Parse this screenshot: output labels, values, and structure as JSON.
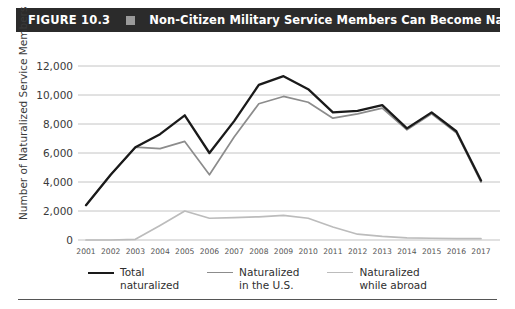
{
  "header": {
    "figure_number": "FIGURE 10.3",
    "marker_icon": "square-marker",
    "title": "Non-Citizen Military Service Members Can Become Naturalized",
    "bar_color": "#2b2b2b",
    "text_color": "#ffffff"
  },
  "legend": {
    "position": "bottom-center",
    "items": [
      {
        "label": "Total\nnaturalized",
        "color": "#1a1a1a"
      },
      {
        "label": "Naturalized\nin the U.S.",
        "color": "#8c8c8c"
      },
      {
        "label": "Naturalized\nwhile abroad",
        "color": "#bcbcbc"
      }
    ]
  },
  "chart_data": {
    "type": "line",
    "title": "Non-Citizen Military Service Members Can Become Naturalized",
    "xlabel": "",
    "ylabel": "Number of Naturalized Service Members",
    "grid": true,
    "ylim": [
      0,
      12000
    ],
    "yticks": [
      0,
      2000,
      4000,
      6000,
      8000,
      10000,
      12000
    ],
    "ytick_labels": [
      "0",
      "2,000",
      "4,000",
      "6,000",
      "8,000",
      "10,000",
      "12,000"
    ],
    "categories": [
      "2001",
      "2002",
      "2003",
      "2004",
      "2005",
      "2006",
      "2007",
      "2008",
      "2009",
      "2010",
      "2011",
      "2012",
      "2013",
      "2014",
      "2015",
      "2016",
      "2017"
    ],
    "series": [
      {
        "name": "Total naturalized",
        "color": "#1a1a1a",
        "width": 2.3,
        "values": [
          2400,
          4500,
          6400,
          7300,
          8600,
          6000,
          8200,
          10700,
          11300,
          10400,
          8800,
          8900,
          9300,
          7700,
          8800,
          7500,
          4100
        ]
      },
      {
        "name": "Naturalized in the U.S.",
        "color": "#8c8c8c",
        "width": 1.7,
        "values": [
          2400,
          4500,
          6400,
          6300,
          6800,
          4500,
          7100,
          9400,
          9900,
          9500,
          8400,
          8700,
          9100,
          7600,
          8700,
          7400,
          4000
        ]
      },
      {
        "name": "Naturalized while abroad",
        "color": "#bcbcbc",
        "width": 1.7,
        "values": [
          0,
          0,
          50,
          1000,
          2000,
          1500,
          1550,
          1600,
          1700,
          1500,
          900,
          400,
          250,
          150,
          120,
          100,
          90
        ]
      }
    ]
  }
}
